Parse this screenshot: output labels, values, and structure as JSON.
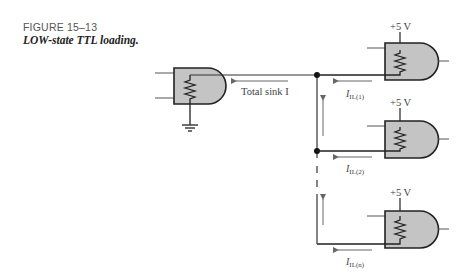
{
  "figure": {
    "number": "FIGURE 15–13",
    "title": "LOW-state TTL loading."
  },
  "diagram": {
    "driver_gate": {
      "label": "driving-gate",
      "current_label": "Total sink I"
    },
    "load_gates": [
      {
        "supply": "+5 V",
        "current_main": "I",
        "current_sub": "IL(1)"
      },
      {
        "supply": "+5 V",
        "current_main": "I",
        "current_sub": "IL(2)"
      },
      {
        "supply": "+5 V",
        "current_main": "I",
        "current_sub": "IL(n)"
      }
    ],
    "colors": {
      "gate_fill": "#c4c4c4",
      "line": "#2a2a2a",
      "arrow": "#666666"
    }
  }
}
